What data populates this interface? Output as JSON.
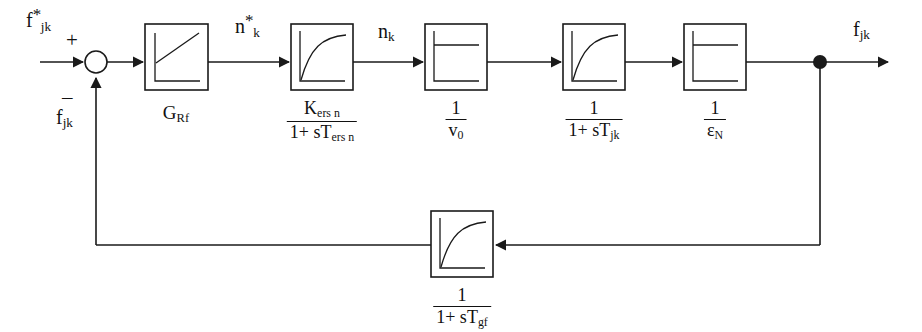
{
  "diagram": {
    "type": "control-block-diagram",
    "stroke_color": "#1a1a1a",
    "background_color": "#ffffff",
    "signals": {
      "input_reference": "f*jk",
      "input_reference_base": "f",
      "input_reference_sub": "jk",
      "input_reference_sup": "*",
      "feedback_label_base": "f",
      "feedback_label_sub": "jk",
      "intermediate_1_base": "n",
      "intermediate_1_sub": "k",
      "intermediate_1_sup": "*",
      "intermediate_2_base": "n",
      "intermediate_2_sub": "k",
      "output_base": "f",
      "output_sub": "jk",
      "plus_sign": "+",
      "minus_sign": "–"
    },
    "blocks": [
      {
        "id": "g-rf",
        "caption_kind": "plain",
        "caption_base": "G",
        "caption_sub": "Rf",
        "icon": "ramp-response-icon",
        "x": 145,
        "y": 24,
        "w": 63,
        "h": 66
      },
      {
        "id": "kers-n",
        "caption_kind": "fraction",
        "numerator_main": "K",
        "numerator_sub": "ers n",
        "denominator_prefix": "1+ sT",
        "denominator_sub": "ers n",
        "icon": "first-order-lag-icon",
        "x": 291,
        "y": 24,
        "w": 62,
        "h": 66
      },
      {
        "id": "inv-v0",
        "caption_kind": "fraction",
        "numerator_main": "1",
        "numerator_sub": "",
        "denominator_prefix": "v",
        "denominator_sub": "0",
        "icon": "step-response-icon",
        "x": 425,
        "y": 24,
        "w": 62,
        "h": 66
      },
      {
        "id": "inv-1-stjk",
        "caption_kind": "fraction",
        "numerator_main": "1",
        "numerator_sub": "",
        "denominator_prefix": "1+ sT",
        "denominator_sub": "jk",
        "icon": "first-order-lag-icon",
        "x": 563,
        "y": 24,
        "w": 62,
        "h": 66
      },
      {
        "id": "inv-eps-n",
        "caption_kind": "fraction",
        "numerator_main": "1",
        "numerator_sub": "",
        "denominator_prefix": "ε",
        "denominator_sub": "N",
        "icon": "step-response-icon",
        "x": 684,
        "y": 24,
        "w": 62,
        "h": 66
      },
      {
        "id": "feedback-1-stgf",
        "caption_kind": "fraction",
        "numerator_main": "1",
        "numerator_sub": "",
        "denominator_prefix": "1+ sT",
        "denominator_sub": "gf",
        "icon": "first-order-lag-icon",
        "x": 431,
        "y": 211,
        "w": 62,
        "h": 66
      }
    ],
    "summing_junction": {
      "name": "summing-junction",
      "cx": 96,
      "cy": 62,
      "r": 11
    },
    "takeoff_node": {
      "name": "takeoff-node",
      "cx": 820,
      "cy": 62,
      "r": 7
    }
  }
}
